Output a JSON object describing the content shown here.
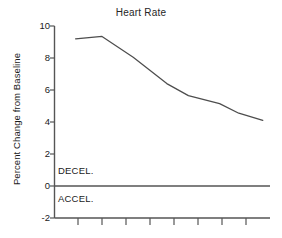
{
  "chart_data": {
    "type": "line",
    "title": "Heart Rate",
    "xlabel": "",
    "ylabel": "Percent Change from Baseline",
    "ylim": [
      -2,
      10
    ],
    "yticks": [
      10,
      8,
      6,
      4,
      2,
      0,
      -2
    ],
    "ytick_labels": [
      "10",
      "8",
      "6",
      "4",
      "2",
      "0",
      "-2"
    ],
    "xlim": [
      0,
      9
    ],
    "xticks": [
      1,
      2,
      3,
      4,
      5,
      6,
      7,
      8
    ],
    "xtick_labels": [
      "",
      "",
      "",
      "",
      "",
      "",
      "",
      ""
    ],
    "grid": false,
    "legend": "none",
    "zero_reference_line": 0,
    "annotations": [
      {
        "text": "DECEL.",
        "x": 0.55,
        "y": 0.95,
        "position": "above-zero-line"
      },
      {
        "text": "ACCEL.",
        "x": 0.55,
        "y": -0.85,
        "position": "below-zero-line"
      }
    ],
    "series": [
      {
        "name": "Heart Rate",
        "color": "#4d4d4d",
        "x": [
          0.9,
          2.0,
          3.3,
          4.7,
          5.6,
          6.9,
          7.7,
          8.7
        ],
        "values": [
          9.2,
          9.35,
          8.05,
          6.4,
          5.65,
          5.15,
          4.55,
          4.1
        ]
      }
    ]
  },
  "figure": {
    "title": "Heart Rate",
    "ylabel": "Percent Change from Baseline",
    "decel_label": "DECEL.",
    "accel_label": "ACCEL.",
    "ytick_labels": [
      "10",
      "8",
      "6",
      "4",
      "2",
      "0",
      "-2"
    ],
    "axis_color": "#555555",
    "line_color": "#4d4d4d",
    "background": "#ffffff"
  }
}
